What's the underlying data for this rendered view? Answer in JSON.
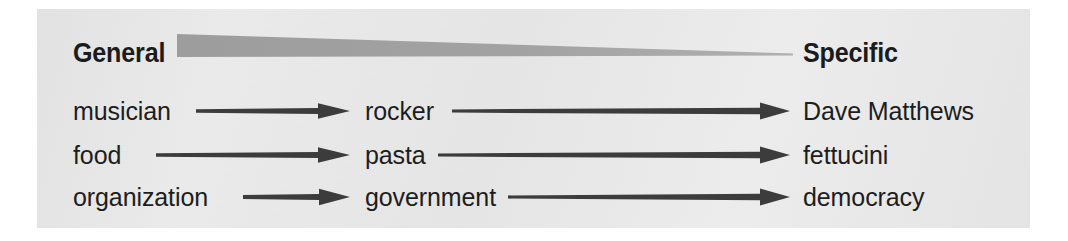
{
  "figure": {
    "kind": "concept-ladder-diagram",
    "panel_color": "#e9e9e9",
    "ink_color": "#3a3a3a",
    "text_color": "#1d1d1d",
    "wedge_color": "#9a9a9a"
  },
  "headings": {
    "left": "General",
    "right": "Specific"
  },
  "columns": {
    "general": "General",
    "middle": "",
    "specific": "Specific"
  },
  "rows": [
    {
      "general": "musician",
      "middle": "rocker",
      "specific": "Dave Matthews"
    },
    {
      "general": "food",
      "middle": "pasta",
      "specific": "fettucini"
    },
    {
      "general": "organization",
      "middle": "government",
      "specific": "democracy"
    }
  ],
  "icons": {
    "arrow": "right-arrow-icon",
    "wedge": "tapering-wedge-icon"
  }
}
